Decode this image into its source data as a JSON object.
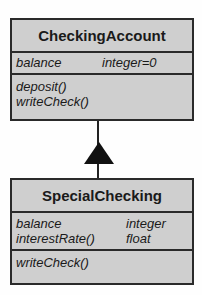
{
  "classes": [
    {
      "name": "CheckingAccount",
      "attributes": [
        {
          "name": "balance",
          "type": "integer=0"
        }
      ],
      "operations": [
        "deposit()",
        "writeCheck()"
      ]
    },
    {
      "name": "SpecialChecking",
      "attributes": [
        {
          "name": "balance",
          "type": "integer"
        },
        {
          "name": "interestRate()",
          "type": "float"
        }
      ],
      "operations": [
        "writeCheck()"
      ]
    }
  ],
  "relationship": {
    "type": "generalization",
    "from": "SpecialChecking",
    "to": "CheckingAccount"
  }
}
